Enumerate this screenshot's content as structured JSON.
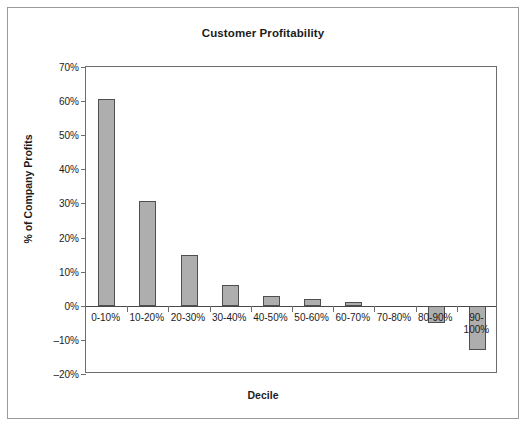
{
  "chart_data": {
    "type": "bar",
    "title": "Customer Profitability",
    "xlabel": "Decile",
    "ylabel": "% of Company Profits",
    "categories": [
      "0-10%",
      "10-20%",
      "20-30%",
      "30-40%",
      "40-50%",
      "50-60%",
      "60-70%",
      "70-80%",
      "80-90%",
      "90-100%"
    ],
    "values": [
      60.5,
      30.8,
      15.0,
      6.0,
      3.0,
      2.0,
      1.0,
      0.0,
      -5.0,
      -13.0
    ],
    "ylim": [
      -20,
      70
    ],
    "ytick_values": [
      70,
      60,
      50,
      40,
      30,
      20,
      10,
      0,
      -10,
      -20
    ],
    "ytick_labels": [
      "70%",
      "60%",
      "50%",
      "40%",
      "30%",
      "20%",
      "10%",
      "0%",
      "–10%",
      "–20%"
    ],
    "grid": false,
    "legend": null,
    "bar_fill_color": "#aeaeae",
    "bar_border_color": "#4f4f4f",
    "axis_color": "#6d6d6d",
    "frame_color": "#9a9a9a",
    "text_color": "#1c1c1c"
  }
}
